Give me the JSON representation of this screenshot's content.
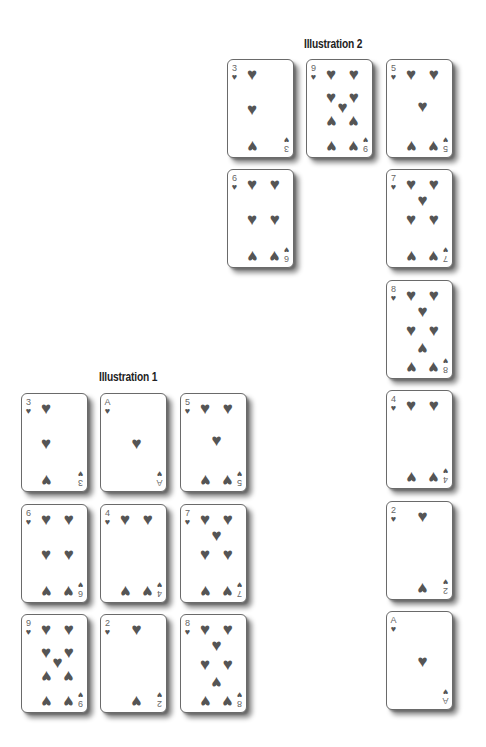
{
  "illustrations": [
    {
      "title": "Illustration 2",
      "title_pos": {
        "x": 304,
        "y": 37
      },
      "cards": [
        {
          "rank": "3",
          "suit": "♥",
          "x": 227,
          "y": 59
        },
        {
          "rank": "9",
          "suit": "♥",
          "x": 306,
          "y": 59
        },
        {
          "rank": "5",
          "suit": "♥",
          "x": 386,
          "y": 59
        },
        {
          "rank": "6",
          "suit": "♥",
          "x": 227,
          "y": 169
        },
        {
          "rank": "7",
          "suit": "♥",
          "x": 386,
          "y": 169
        },
        {
          "rank": "8",
          "suit": "♥",
          "x": 386,
          "y": 280
        },
        {
          "rank": "4",
          "suit": "♥",
          "x": 386,
          "y": 390
        },
        {
          "rank": "2",
          "suit": "♥",
          "x": 386,
          "y": 501
        },
        {
          "rank": "A",
          "suit": "♥",
          "x": 386,
          "y": 611
        }
      ]
    },
    {
      "title": "Illustration 1",
      "title_pos": {
        "x": 99,
        "y": 370
      },
      "cards": [
        {
          "rank": "3",
          "suit": "♥",
          "x": 21,
          "y": 393
        },
        {
          "rank": "A",
          "suit": "♥",
          "x": 100,
          "y": 393
        },
        {
          "rank": "5",
          "suit": "♥",
          "x": 180,
          "y": 393
        },
        {
          "rank": "6",
          "suit": "♥",
          "x": 21,
          "y": 504
        },
        {
          "rank": "4",
          "suit": "♥",
          "x": 100,
          "y": 504
        },
        {
          "rank": "7",
          "suit": "♥",
          "x": 180,
          "y": 504
        },
        {
          "rank": "9",
          "suit": "♥",
          "x": 21,
          "y": 614
        },
        {
          "rank": "2",
          "suit": "♥",
          "x": 100,
          "y": 614
        },
        {
          "rank": "8",
          "suit": "♥",
          "x": 180,
          "y": 614
        }
      ]
    }
  ]
}
